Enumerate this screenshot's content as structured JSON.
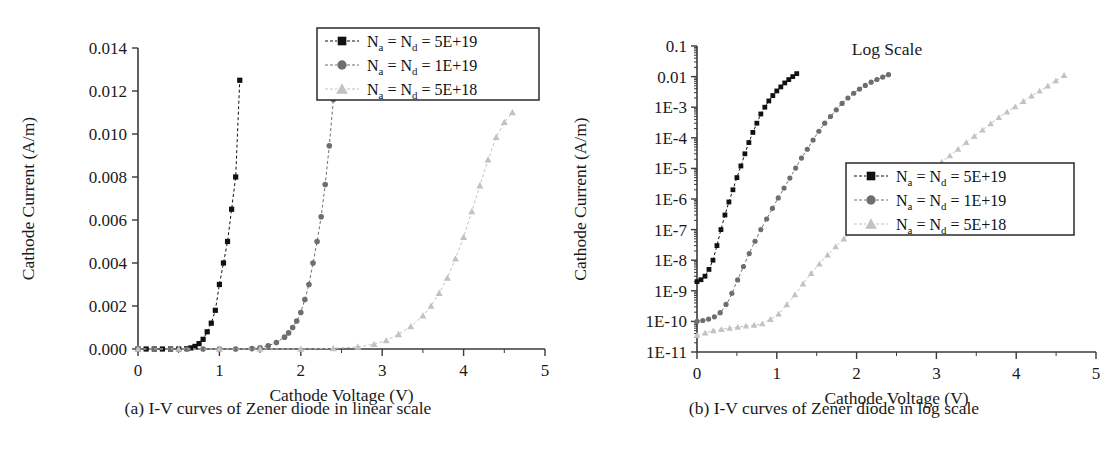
{
  "figure": {
    "panels": [
      {
        "id": "linear",
        "caption": "(a) I-V curves of Zener diode in linear scale",
        "xlabel": "Cathode Voltage (V)",
        "ylabel": "Cathode Current (A/m)",
        "annotation": "",
        "xticks": [
          "0",
          "1",
          "2",
          "3",
          "4",
          "5"
        ],
        "yticks": [
          "0.000",
          "0.002",
          "0.004",
          "0.006",
          "0.008",
          "0.010",
          "0.012",
          "0.014"
        ],
        "legend": [
          {
            "marker": "square",
            "color": "#111111",
            "label_prefix": "N",
            "sub_a": "a",
            "mid": " = N",
            "sub_d": "d",
            "value": " = 5E+19"
          },
          {
            "marker": "circle",
            "color": "#6e6e6e",
            "label_prefix": "N",
            "sub_a": "a",
            "mid": " = N",
            "sub_d": "d",
            "value": " = 1E+19"
          },
          {
            "marker": "triangle",
            "color": "#c2c2c2",
            "label_prefix": "N",
            "sub_a": "a",
            "mid": " = N",
            "sub_d": "d",
            "value": " = 5E+18"
          }
        ]
      },
      {
        "id": "log",
        "caption": "(b) I-V curves of Zener diode in log scale",
        "xlabel": "Cathode Voltage (V)",
        "ylabel": "Cathode Current (A/m)",
        "annotation": "Log Scale",
        "xticks": [
          "0",
          "1",
          "2",
          "3",
          "4",
          "5"
        ],
        "yticks": [
          "0.1",
          "0.01",
          "1E-3",
          "1E-4",
          "1E-5",
          "1E-6",
          "1E-7",
          "1E-8",
          "1E-9",
          "1E-10",
          "1E-11"
        ],
        "legend": [
          {
            "marker": "square",
            "color": "#111111",
            "label_prefix": "N",
            "sub_a": "a",
            "mid": " = N",
            "sub_d": "d",
            "value": " = 5E+19"
          },
          {
            "marker": "circle",
            "color": "#6e6e6e",
            "label_prefix": "N",
            "sub_a": "a",
            "mid": " = N",
            "sub_d": "d",
            "value": " = 1E+19"
          },
          {
            "marker": "triangle",
            "color": "#c2c2c2",
            "label_prefix": "N",
            "sub_a": "a",
            "mid": " = N",
            "sub_d": "d",
            "value": " = 5E+18"
          }
        ]
      }
    ]
  },
  "chart_data": [
    {
      "type": "line",
      "id": "linear",
      "title": "(a) I-V curves of Zener diode in linear scale",
      "xlabel": "Cathode Voltage (V)",
      "ylabel": "Cathode Current (A/m)",
      "xlim": [
        0,
        5
      ],
      "ylim": [
        0,
        0.014
      ],
      "grid": false,
      "legend_position": "top-right",
      "xticks": [
        0,
        1,
        2,
        3,
        4,
        5
      ],
      "yticks": [
        0.0,
        0.002,
        0.004,
        0.006,
        0.008,
        0.01,
        0.012,
        0.014
      ],
      "series": [
        {
          "name": "Na = Nd = 5E+19",
          "marker": "square",
          "color": "#111111",
          "x": [
            0.0,
            0.1,
            0.2,
            0.3,
            0.4,
            0.5,
            0.6,
            0.65,
            0.7,
            0.75,
            0.8,
            0.85,
            0.9,
            0.95,
            1.0,
            1.05,
            1.1,
            1.15,
            1.2,
            1.25
          ],
          "y": [
            0.0,
            0.0,
            0.0,
            0.0,
            0.0,
            0.0,
            2e-05,
            5e-05,
            0.00012,
            0.00025,
            0.00045,
            0.0008,
            0.0012,
            0.0018,
            0.003,
            0.004,
            0.005,
            0.0065,
            0.008,
            0.0125
          ]
        },
        {
          "name": "Na = Nd = 1E+19",
          "marker": "circle",
          "color": "#6e6e6e",
          "x": [
            0.0,
            0.2,
            0.4,
            0.6,
            0.8,
            1.0,
            1.2,
            1.4,
            1.5,
            1.6,
            1.7,
            1.8,
            1.85,
            1.9,
            1.95,
            2.0,
            2.05,
            2.1,
            2.15,
            2.2,
            2.25,
            2.3,
            2.35,
            2.4
          ],
          "y": [
            0.0,
            0.0,
            0.0,
            0.0,
            0.0,
            0.0,
            0.0,
            2e-05,
            6e-05,
            0.00015,
            0.0003,
            0.00055,
            0.00075,
            0.001,
            0.0013,
            0.0017,
            0.0023,
            0.003,
            0.004,
            0.005,
            0.00615,
            0.00765,
            0.00945,
            0.0116
          ]
        },
        {
          "name": "Na = Nd = 5E+18",
          "marker": "triangle",
          "color": "#c2c2c2",
          "x": [
            0.0,
            0.5,
            1.0,
            1.5,
            2.0,
            2.4,
            2.7,
            2.9,
            3.05,
            3.2,
            3.35,
            3.5,
            3.6,
            3.7,
            3.8,
            3.9,
            4.0,
            4.1,
            4.2,
            4.3,
            4.4,
            4.5,
            4.6
          ],
          "y": [
            0.0,
            0.0,
            0.0,
            0.0,
            0.0,
            3e-05,
            0.0001,
            0.00022,
            0.0004,
            0.00068,
            0.00105,
            0.00155,
            0.002,
            0.0026,
            0.0033,
            0.0042,
            0.0052,
            0.0064,
            0.0076,
            0.0088,
            0.00985,
            0.01055,
            0.011
          ]
        }
      ]
    },
    {
      "type": "line",
      "id": "log",
      "title": "(b) I-V curves of Zener diode in log scale",
      "xlabel": "Cathode Voltage (V)",
      "ylabel": "Cathode Current (A/m)",
      "annotation": "Log Scale",
      "xlim": [
        0,
        5
      ],
      "ylim": [
        1e-11,
        0.1
      ],
      "yscale": "log",
      "grid": false,
      "legend_position": "right-middle",
      "xticks": [
        0,
        1,
        2,
        3,
        4,
        5
      ],
      "yticks": [
        0.1,
        0.01,
        0.001,
        0.0001,
        1e-05,
        1e-06,
        1e-07,
        1e-08,
        1e-09,
        1e-10,
        1e-11
      ],
      "series": [
        {
          "name": "Na = Nd = 5E+19",
          "marker": "square",
          "color": "#111111",
          "x": [
            0.0,
            0.05,
            0.1,
            0.15,
            0.2,
            0.25,
            0.3,
            0.35,
            0.4,
            0.45,
            0.5,
            0.55,
            0.6,
            0.65,
            0.7,
            0.75,
            0.8,
            0.85,
            0.9,
            0.95,
            1.0,
            1.05,
            1.1,
            1.15,
            1.2,
            1.25
          ],
          "y": [
            2e-09,
            2.3e-09,
            3e-09,
            5e-09,
            1e-08,
            3e-08,
            1e-07,
            3e-07,
            8e-07,
            2e-06,
            5e-06,
            1.2e-05,
            3e-05,
            7e-05,
            0.00015,
            0.0003,
            0.0006,
            0.001,
            0.0016,
            0.0024,
            0.0034,
            0.0046,
            0.0062,
            0.008,
            0.01,
            0.0125
          ]
        },
        {
          "name": "Na = Nd = 1E+19",
          "marker": "circle",
          "color": "#6e6e6e",
          "x": [
            0.0,
            0.1,
            0.2,
            0.3,
            0.4,
            0.5,
            0.6,
            0.7,
            0.8,
            0.9,
            1.0,
            1.1,
            1.2,
            1.3,
            1.4,
            1.5,
            1.6,
            1.7,
            1.8,
            1.9,
            2.0,
            2.1,
            2.2,
            2.3,
            2.4
          ],
          "y": [
            1e-10,
            1.1e-10,
            1.3e-10,
            2e-10,
            5e-10,
            2e-09,
            8e-09,
            3e-08,
            1e-07,
            3e-07,
            9e-07,
            2.5e-06,
            7e-06,
            2e-05,
            5e-05,
            0.00013,
            0.0003,
            0.0006,
            0.0012,
            0.0021,
            0.0034,
            0.005,
            0.007,
            0.009,
            0.0116
          ]
        },
        {
          "name": "Na = Nd = 5E+18",
          "marker": "triangle",
          "color": "#c2c2c2",
          "x": [
            0.0,
            0.2,
            0.4,
            0.6,
            0.8,
            1.0,
            1.2,
            1.4,
            1.6,
            1.8,
            2.0,
            2.2,
            2.4,
            2.6,
            2.8,
            3.0,
            3.2,
            3.4,
            3.6,
            3.8,
            4.0,
            4.2,
            4.4,
            4.6
          ],
          "y": [
            3.5e-11,
            5e-11,
            6e-11,
            7e-11,
            8e-11,
            1.5e-10,
            6e-10,
            3e-09,
            1.2e-08,
            4e-08,
            1.2e-07,
            3.5e-07,
            9e-07,
            2.2e-06,
            5e-06,
            1.2e-05,
            3e-05,
            8e-05,
            0.0002,
            0.0005,
            0.0011,
            0.0024,
            0.005,
            0.011
          ]
        }
      ]
    }
  ]
}
